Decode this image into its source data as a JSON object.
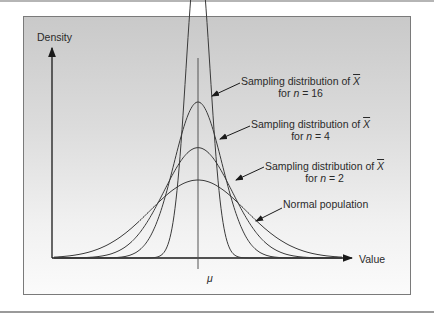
{
  "chart_data": {
    "type": "line",
    "title": "",
    "xlabel": "Value",
    "ylabel": "Density",
    "x_ticks": [
      "μ"
    ],
    "grid": false,
    "legend": "annotations with arrows",
    "series": [
      {
        "name": "Sampling distribution of X̄ for n = 16",
        "n": 16,
        "relative_sd": 0.25,
        "relative_peak": 4.0
      },
      {
        "name": "Sampling distribution of X̄ for n = 4",
        "n": 4,
        "relative_sd": 0.5,
        "relative_peak": 2.0
      },
      {
        "name": "Sampling distribution of X̄ for n = 2",
        "n": 2,
        "relative_sd": 0.707,
        "relative_peak": 1.41
      },
      {
        "name": "Normal population",
        "n": 1,
        "relative_sd": 1.0,
        "relative_peak": 1.0
      }
    ]
  },
  "axes": {
    "y_label": "Density",
    "x_label": "Value",
    "center_tick": "μ"
  },
  "annotations": [
    {
      "line1": "Sampling distribution of ",
      "xbar": "X",
      "line2_pre": "for ",
      "n_var": "n",
      "line2_post": " = 16"
    },
    {
      "line1": "Sampling distribution of ",
      "xbar": "X",
      "line2_pre": "for ",
      "n_var": "n",
      "line2_post": " = 4"
    },
    {
      "line1": "Sampling distribution of ",
      "xbar": "X",
      "line2_pre": "for ",
      "n_var": "n",
      "line2_post": " = 2"
    },
    {
      "line1": "Normal population"
    }
  ],
  "colors": {
    "curve": "#3a3a3a",
    "axis": "#1a1a1a",
    "frame": "#7a7a7a"
  }
}
